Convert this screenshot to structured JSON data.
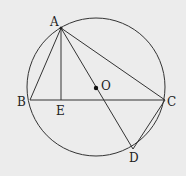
{
  "diagram": {
    "background": "#ececec",
    "stroke": "#333333",
    "circle": {
      "cx": 96,
      "cy": 87,
      "r": 69,
      "label": "O"
    },
    "points": {
      "A": {
        "x": 61,
        "y": 28,
        "label": "A"
      },
      "B": {
        "x": 30,
        "y": 100,
        "label": "B"
      },
      "C": {
        "x": 165,
        "y": 100,
        "label": "C"
      },
      "D": {
        "x": 133,
        "y": 149,
        "label": "D"
      },
      "E": {
        "x": 61,
        "y": 100,
        "label": "E"
      },
      "O": {
        "x": 96,
        "y": 88,
        "label": "O"
      }
    },
    "segments": [
      "AB",
      "AC",
      "BC",
      "AE",
      "AD",
      "CD"
    ]
  }
}
